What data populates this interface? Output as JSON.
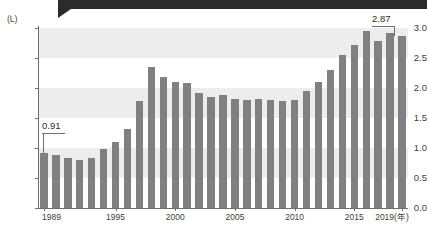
{
  "chart_data": {
    "type": "bar",
    "title": "",
    "subtitle": "",
    "xlabel": "年",
    "ylabel": "",
    "unit_label": "(L)",
    "ylim": [
      0.0,
      3.0
    ],
    "grid": "horizontal-bands",
    "legend": "none",
    "y_ticks": [
      "0.0",
      "0.5",
      "1.0",
      "1.5",
      "2.0",
      "2.5",
      "3.0"
    ],
    "y_tick_values": [
      0.0,
      0.5,
      1.0,
      1.5,
      2.0,
      2.5,
      3.0
    ],
    "x_tick_labels": [
      "1989",
      "1995",
      "2000",
      "2005",
      "2010",
      "2015",
      "2019(年)"
    ],
    "x_tick_years": [
      1989,
      1995,
      2000,
      2005,
      2010,
      2015,
      2019
    ],
    "categories": [
      "1989",
      "1990",
      "1991",
      "1992",
      "1993",
      "1994",
      "1995",
      "1996",
      "1997",
      "1998",
      "1999",
      "2000",
      "2001",
      "2002",
      "2003",
      "2004",
      "2005",
      "2006",
      "2007",
      "2008",
      "2009",
      "2010",
      "2011",
      "2012",
      "2013",
      "2014",
      "2015",
      "2016",
      "2017",
      "2018",
      "2019"
    ],
    "values": [
      0.91,
      0.88,
      0.84,
      0.8,
      0.84,
      0.98,
      1.1,
      1.32,
      1.78,
      2.35,
      2.18,
      2.1,
      2.08,
      1.92,
      1.85,
      1.88,
      1.82,
      1.8,
      1.82,
      1.8,
      1.78,
      1.8,
      1.95,
      2.1,
      2.3,
      2.55,
      2.72,
      2.95,
      2.78,
      2.92,
      2.87
    ],
    "annotations": [
      {
        "label": "0.91",
        "category": "1989",
        "value": 0.91
      },
      {
        "label": "2.87",
        "category": "2019",
        "value": 2.87
      }
    ],
    "colors": {
      "bar": "#808080",
      "band": "#ededed",
      "axis": "#6e6e6e",
      "text": "#3d3d3d",
      "top_cut": "#2b2b2b"
    }
  }
}
